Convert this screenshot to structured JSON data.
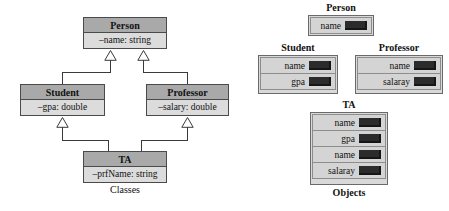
{
  "diagram": {
    "title_left": "Classes",
    "title_right": "Objects",
    "classes": [
      {
        "id": "person",
        "name": "Person",
        "attribute": "–name: string"
      },
      {
        "id": "student",
        "name": "Student",
        "attribute": "–gpa: double"
      },
      {
        "id": "professor",
        "name": "Professor",
        "attribute": "–salary: double"
      },
      {
        "id": "ta",
        "name": "TA",
        "attribute": "–prfName: string"
      }
    ],
    "generalizations": [
      {
        "from": "student",
        "to": "person"
      },
      {
        "from": "professor",
        "to": "person"
      },
      {
        "from": "ta",
        "to": "student"
      },
      {
        "from": "ta",
        "to": "professor"
      }
    ],
    "objects": [
      {
        "id": "obj-person",
        "label": "Person",
        "slots": [
          "name"
        ]
      },
      {
        "id": "obj-student",
        "label": "Student",
        "slots": [
          "name",
          "gpa"
        ]
      },
      {
        "id": "obj-professor",
        "label": "Professor",
        "slots": [
          "name",
          "salaray"
        ]
      },
      {
        "id": "obj-ta",
        "label": "TA",
        "slots": [
          "name",
          "gpa",
          "name",
          "salaray"
        ]
      }
    ]
  },
  "colors": {
    "header_fill": "#a9a9a9",
    "attribute_fill": "#dcdcdc",
    "box_border": "#4a4a4a",
    "value_chip": "#2b2b2b",
    "background": "#ffffff"
  }
}
